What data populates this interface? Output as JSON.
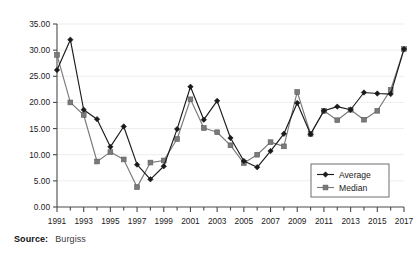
{
  "source": {
    "label": "Source:",
    "value": "Burgiss"
  },
  "legend": {
    "position": "bottom-right",
    "items": [
      {
        "name": "Average",
        "color": "#1a1a1a",
        "marker": "diamond"
      },
      {
        "name": "Median",
        "color": "#7a7a7a",
        "marker": "square"
      }
    ]
  },
  "chart_data": {
    "type": "line",
    "title": "",
    "xlabel": "",
    "ylabel": "",
    "ylim": [
      0,
      35
    ],
    "ytick_step": 5,
    "grid": true,
    "ytick_labels": [
      "0.00",
      "5.00",
      "10.00",
      "15.00",
      "20.00",
      "25.00",
      "30.00",
      "35.00"
    ],
    "ytick_values": [
      0,
      5,
      10,
      15,
      20,
      25,
      30,
      35
    ],
    "x": [
      1991,
      1992,
      1993,
      1994,
      1995,
      1996,
      1997,
      1998,
      1999,
      2000,
      2001,
      2002,
      2003,
      2004,
      2005,
      2006,
      2007,
      2008,
      2009,
      2010,
      2011,
      2012,
      2013,
      2014,
      2015,
      2016,
      2017
    ],
    "xtick_labels": [
      "1991",
      "1993",
      "1995",
      "1997",
      "1999",
      "2001",
      "2003",
      "2005",
      "2007",
      "2009",
      "2011",
      "2013",
      "2015",
      "2017"
    ],
    "xtick_values": [
      1991,
      1993,
      1995,
      1997,
      1999,
      2001,
      2003,
      2005,
      2007,
      2009,
      2011,
      2013,
      2015,
      2017
    ],
    "xlim": [
      1991,
      2017
    ],
    "series": [
      {
        "name": "Average",
        "color": "#1a1a1a",
        "marker": "diamond",
        "values": [
          26.2,
          32.0,
          18.6,
          16.8,
          11.5,
          15.4,
          8.1,
          5.3,
          7.8,
          14.9,
          23.0,
          16.7,
          20.3,
          13.2,
          8.8,
          7.6,
          10.7,
          14.0,
          19.9,
          13.9,
          18.4,
          19.2,
          18.6,
          21.9,
          21.7,
          21.6,
          30.2
        ]
      },
      {
        "name": "Median",
        "color": "#7a7a7a",
        "marker": "square",
        "values": [
          29.1,
          20.0,
          17.6,
          8.7,
          10.5,
          9.1,
          3.8,
          8.5,
          8.9,
          13.0,
          20.6,
          15.1,
          14.3,
          11.8,
          8.4,
          10.0,
          12.4,
          11.6,
          22.0,
          14.0,
          18.4,
          16.6,
          18.6,
          16.7,
          18.4,
          22.4,
          30.2
        ]
      }
    ]
  }
}
